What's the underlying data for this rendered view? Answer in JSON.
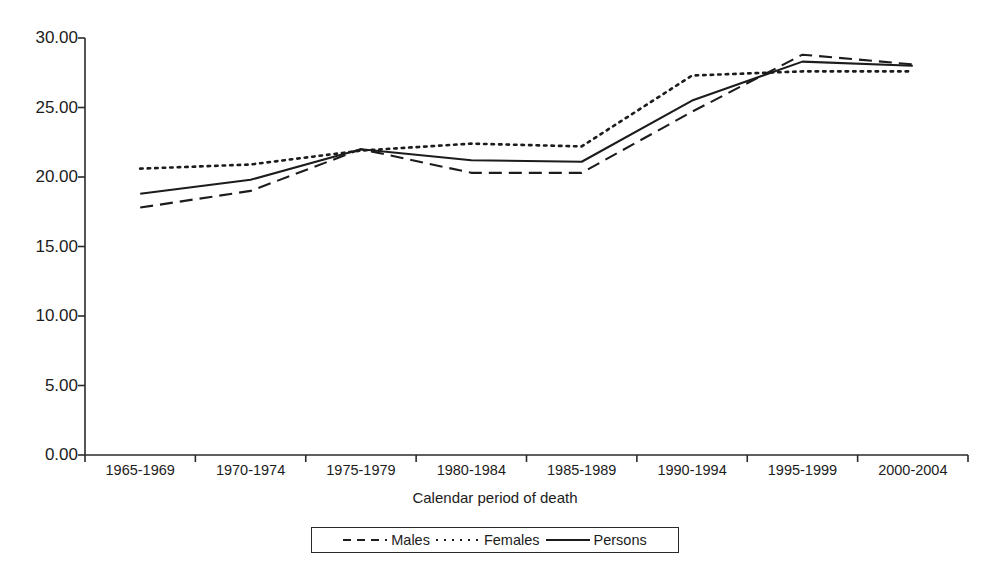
{
  "chart_data": {
    "type": "line",
    "title": "",
    "xlabel": "Calendar period of death",
    "ylabel": "",
    "categories": [
      "1965-1969",
      "1970-1974",
      "1975-1979",
      "1980-1984",
      "1985-1989",
      "1990-1994",
      "1995-1999",
      "2000-2004"
    ],
    "ylim": [
      0.0,
      30.0
    ],
    "yticks": [
      "0.00",
      "5.00",
      "10.00",
      "15.00",
      "20.00",
      "25.00",
      "30.00"
    ],
    "ytick_values": [
      0,
      5,
      10,
      15,
      20,
      25,
      30
    ],
    "grid": false,
    "legend_position": "bottom",
    "series": [
      {
        "name": "Males",
        "style": "dashed",
        "color": "#1c1c1c",
        "values": [
          17.8,
          19.0,
          22.0,
          20.3,
          20.3,
          24.7,
          28.8,
          28.1
        ]
      },
      {
        "name": "Females",
        "style": "dotted",
        "color": "#1c1c1c",
        "values": [
          20.6,
          20.9,
          21.9,
          22.4,
          22.2,
          27.3,
          27.6,
          27.6
        ]
      },
      {
        "name": "Persons",
        "style": "solid",
        "color": "#1c1c1c",
        "values": [
          18.8,
          19.8,
          22.0,
          21.2,
          21.1,
          25.5,
          28.3,
          28.0
        ]
      }
    ]
  },
  "legend": {
    "items": [
      {
        "label": "Males",
        "swatch": "dashed-line-swatch"
      },
      {
        "label": "Females",
        "swatch": "dotted-line-swatch"
      },
      {
        "label": "Persons",
        "swatch": "solid-line-swatch"
      }
    ]
  },
  "axis": {
    "x_title": "Calendar period of death"
  }
}
